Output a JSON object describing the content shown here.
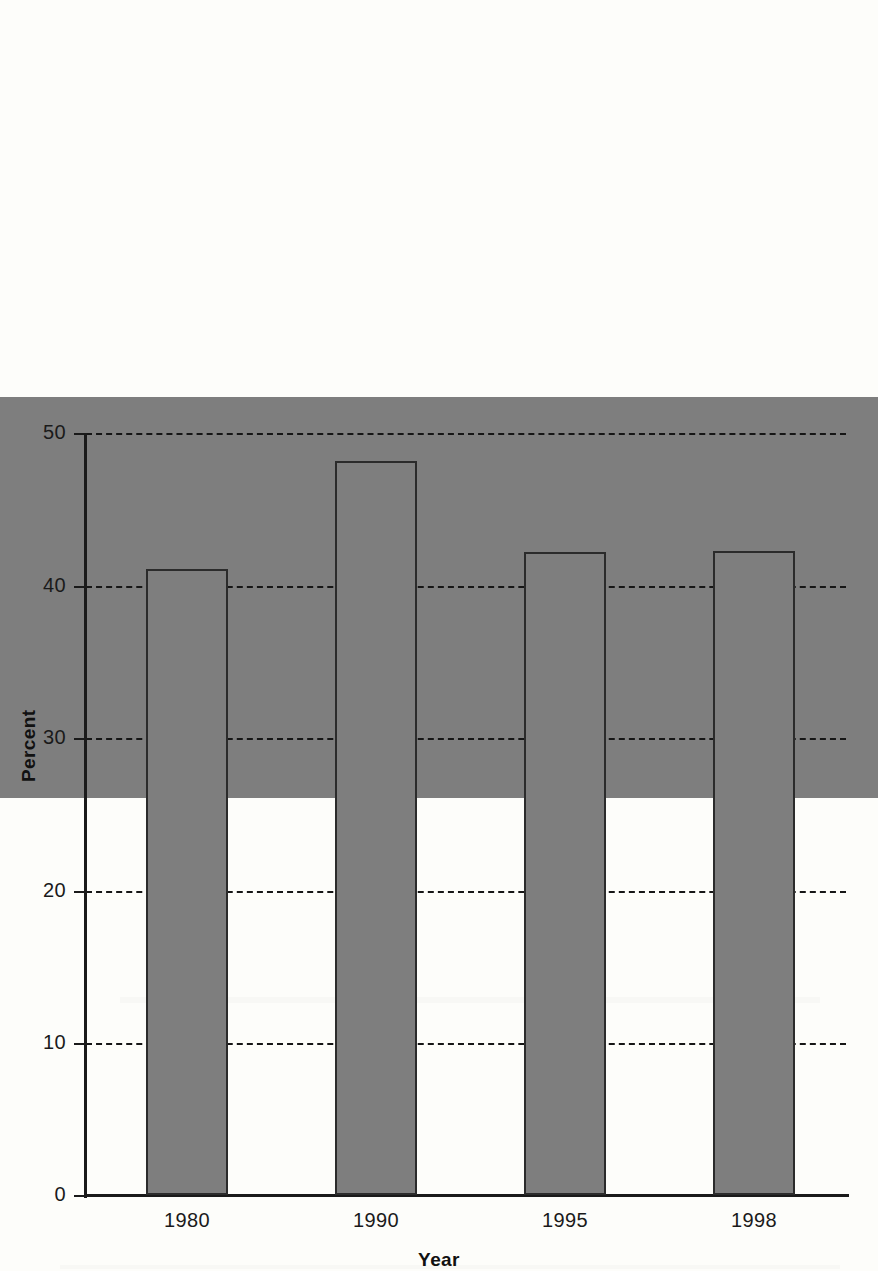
{
  "chart_data": {
    "type": "bar",
    "title": "",
    "xlabel": "Year",
    "ylabel": "Percent",
    "categories": [
      "1980",
      "1990",
      "1995",
      "1998"
    ],
    "values": [
      26.3,
      41.1,
      48.2,
      42.2
    ],
    "ylim": [
      0,
      50
    ],
    "yticks": [
      0,
      10,
      20,
      30,
      40,
      50
    ],
    "ytick_labels": [
      "0",
      "10",
      "20",
      "30",
      "40",
      "50"
    ],
    "grid": "horizontal-dashed",
    "legend": "none",
    "series": [
      {
        "name": "Percent",
        "color": "#7e7e7e",
        "values": [
          26.3,
          41.1,
          48.2,
          42.2
        ]
      }
    ]
  },
  "colors": {
    "bar_fill": "#7e7e7e",
    "bar_border": "#2b2b2b",
    "axis": "#1a1a1a",
    "grid": "#161616",
    "background": "#fdfdfa"
  }
}
